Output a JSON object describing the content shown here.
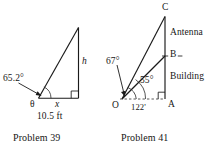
{
  "figure": {
    "type": "textbook-geometry-figures",
    "background_color": "#ffffff",
    "ink_color": "#1a1a1a",
    "panels": [
      {
        "id": "problem-39",
        "caption": "Problem 39",
        "shape": "right-triangle",
        "description": "Right triangle with acute angle theta at lower-left vertex, right angle at lower-right vertex, vertical leg h on the right, horizontal leg x along the base.",
        "labels": {
          "angle_value": "65.2°",
          "angle_symbol": "θ",
          "base_variable": "x",
          "base_measure": "10.5 ft",
          "height_variable": "h"
        },
        "measurements": {
          "angle_deg": 65.2,
          "base_length": "10.5 ft",
          "unknown_side": "h"
        }
      },
      {
        "id": "problem-41",
        "caption": "Problem 41",
        "shape": "building-with-antenna",
        "description": "Observer at point O on level ground views building top B at 55 degrees and antenna top C at 67 degrees; the base of the building is at point A, 122 feet from O.",
        "labels": {
          "vertex_observer": "O",
          "vertex_base": "A",
          "vertex_building_top": "B",
          "vertex_antenna_top": "C",
          "angle_upper": "67°",
          "angle_lower": "55°",
          "segment_antenna": "Antenna",
          "segment_building": "Building",
          "ground_distance": "122'"
        },
        "measurements": {
          "angle_to_antenna_top_deg": 67,
          "angle_to_building_top_deg": 55,
          "ground_distance": "122'"
        }
      }
    ]
  },
  "captions": {
    "left": "Problem 39",
    "right": "Problem 41"
  }
}
